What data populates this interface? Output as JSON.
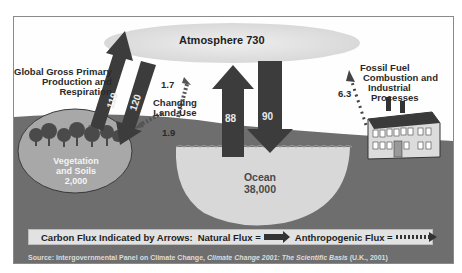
{
  "diagram": {
    "reservoirs": {
      "atmosphere": {
        "label": "Atmosphere 730",
        "name": "Atmosphere",
        "value": 730
      },
      "vegetation": {
        "line1": "Vegetation",
        "line2": "and Soils",
        "value": "2,000"
      },
      "ocean": {
        "line1": "Ocean",
        "value": "38,000"
      }
    },
    "fluxes": {
      "gpp_up": {
        "value": "119",
        "type": "natural",
        "direction": "vegetation-to-atmosphere"
      },
      "gpp_down": {
        "value": "120",
        "type": "natural",
        "direction": "atmosphere-to-vegetation"
      },
      "ocean_up": {
        "value": "88",
        "type": "natural",
        "direction": "ocean-to-atmosphere"
      },
      "ocean_down": {
        "value": "90",
        "type": "natural",
        "direction": "atmosphere-to-ocean"
      },
      "landuse_up": {
        "value": "1.7",
        "type": "anthropogenic",
        "direction": "land-to-atmosphere"
      },
      "landuse_down": {
        "value": "1.9",
        "type": "anthropogenic",
        "direction": "atmosphere-to-land"
      },
      "fossil": {
        "value": "6.3",
        "type": "anthropogenic",
        "direction": "industry-to-atmosphere"
      }
    },
    "labels": {
      "gpp_line1": "Global Gross Primary",
      "gpp_line2": "Production and",
      "gpp_line3": "Respiration",
      "landuse_line1": "Changing",
      "landuse_line2": "Land-Use",
      "fossil_line1": "Fossil Fuel",
      "fossil_line2": "Combustion and",
      "fossil_line3": "Industrial",
      "fossil_line4": "Processes"
    },
    "legend": {
      "prefix": "Carbon Flux Indicated by Arrows:",
      "natural": "Natural Flux =",
      "anthropogenic": "Anthropogenic Flux ="
    },
    "source": {
      "prefix": "Source: Intergovernmental Panel on Climate Change,",
      "title": "Climate Change 2001: The Scientific Basis",
      "suffix": "(U.K., 2001)"
    },
    "colors": {
      "ground": "#6e6e6e",
      "arrow": "#3c3c3c",
      "atmosphere_cloud": "#e4e4e4",
      "ocean": "#d8d8d8",
      "vegetation_ellipse": "#9a9a9a",
      "legend_bg": "#e2e2e2"
    }
  }
}
